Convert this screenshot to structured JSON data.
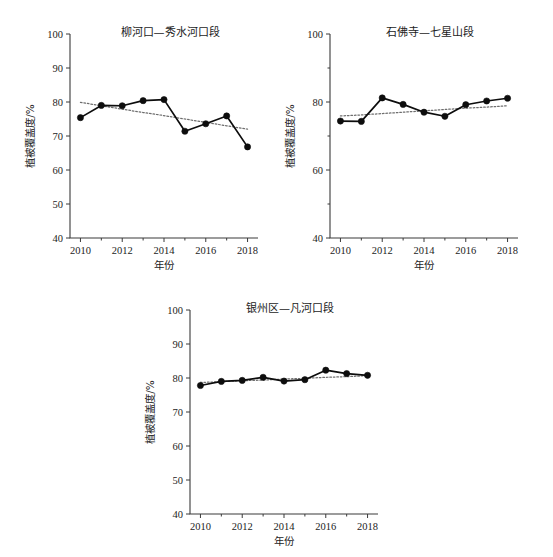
{
  "figure": {
    "axis_titles": {
      "x": "年份",
      "y": "植被覆盖度/%"
    }
  },
  "chart_data": [
    {
      "type": "line",
      "title": "柳河口—秀水河口段",
      "xlabel": "年份",
      "ylabel": "植被覆盖度/%",
      "xlim": [
        2009.5,
        2018.5
      ],
      "ylim": [
        40,
        100
      ],
      "xticks": [
        2010,
        2012,
        2014,
        2016,
        2018
      ],
      "xtick_labels": [
        "2010",
        "2012",
        "2014",
        "2016",
        "2018"
      ],
      "yticks": [
        40,
        50,
        60,
        70,
        80,
        90,
        100
      ],
      "ytick_labels": [
        "40",
        "50",
        "60",
        "70",
        "80",
        "90",
        "100"
      ],
      "x": [
        2010,
        2011,
        2012,
        2013,
        2014,
        2015,
        2016,
        2017,
        2018
      ],
      "values": [
        75.4,
        79.0,
        78.9,
        80.4,
        80.7,
        71.4,
        73.6,
        75.9,
        66.8
      ],
      "series": [
        {
          "name": "植被覆盖度",
          "style": "solid-with-markers",
          "values": [
            75.4,
            79.0,
            78.9,
            80.4,
            80.7,
            71.4,
            73.6,
            75.9,
            66.8
          ]
        },
        {
          "name": "趋势线",
          "style": "dotted",
          "values": [
            79.9,
            78.9,
            77.9,
            76.9,
            76.0,
            75.0,
            74.0,
            73.0,
            72.0
          ]
        }
      ],
      "grid": false,
      "legend": "none"
    },
    {
      "type": "line",
      "title": "石佛寺—七星山段",
      "xlabel": "年份",
      "ylabel": "植被覆盖度/%",
      "xlim": [
        2009.5,
        2018.5
      ],
      "ylim": [
        40,
        100
      ],
      "xticks": [
        2010,
        2012,
        2014,
        2016,
        2018
      ],
      "xtick_labels": [
        "2010",
        "2012",
        "2014",
        "2016",
        "2018"
      ],
      "yticks": [
        40,
        60,
        80,
        100
      ],
      "ytick_labels": [
        "40",
        "60",
        "80",
        "100"
      ],
      "x": [
        2010,
        2011,
        2012,
        2013,
        2014,
        2015,
        2016,
        2017,
        2018
      ],
      "values": [
        74.4,
        74.3,
        81.2,
        79.3,
        77.0,
        75.8,
        79.2,
        80.3,
        81.1
      ],
      "series": [
        {
          "name": "植被覆盖度",
          "style": "solid-with-markers",
          "values": [
            74.4,
            74.3,
            81.2,
            79.3,
            77.0,
            75.8,
            79.2,
            80.3,
            81.1
          ]
        },
        {
          "name": "趋势线",
          "style": "dotted",
          "values": [
            75.9,
            76.2,
            76.6,
            77.0,
            77.4,
            77.8,
            78.2,
            78.5,
            78.9
          ]
        }
      ],
      "grid": false,
      "legend": "none"
    },
    {
      "type": "line",
      "title": "银州区—凡河口段",
      "xlabel": "年份",
      "ylabel": "植被覆盖度/%",
      "xlim": [
        2009.5,
        2018.5
      ],
      "ylim": [
        40,
        100
      ],
      "xticks": [
        2010,
        2012,
        2014,
        2016,
        2018
      ],
      "xtick_labels": [
        "2010",
        "2012",
        "2014",
        "2016",
        "2018"
      ],
      "yticks": [
        40,
        50,
        60,
        70,
        80,
        90,
        100
      ],
      "ytick_labels": [
        "40",
        "50",
        "60",
        "70",
        "80",
        "90",
        "100"
      ],
      "x": [
        2010,
        2011,
        2012,
        2013,
        2014,
        2015,
        2016,
        2017,
        2018
      ],
      "values": [
        77.8,
        79.0,
        79.3,
        80.2,
        79.1,
        79.5,
        82.3,
        81.3,
        80.8
      ],
      "series": [
        {
          "name": "植被覆盖度",
          "style": "solid-with-markers",
          "values": [
            77.8,
            79.0,
            79.3,
            80.2,
            79.1,
            79.5,
            82.3,
            81.3,
            80.8
          ]
        },
        {
          "name": "趋势线",
          "style": "dotted",
          "values": [
            78.7,
            78.9,
            79.2,
            79.4,
            79.7,
            79.9,
            80.2,
            80.4,
            80.7
          ]
        }
      ],
      "grid": false,
      "legend": "none"
    }
  ]
}
